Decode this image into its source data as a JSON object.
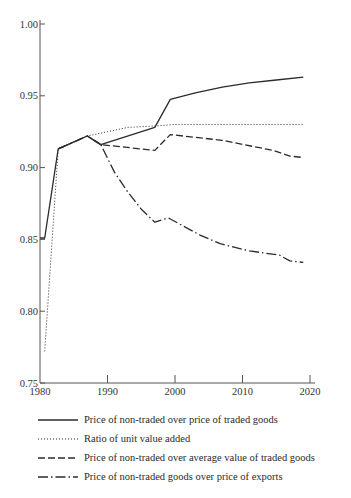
{
  "chart_data": {
    "type": "line",
    "title": "",
    "xlabel": "",
    "ylabel": "",
    "xlim": [
      1980,
      2020
    ],
    "ylim": [
      0.75,
      1.0
    ],
    "xticks": [
      1980,
      1990,
      2000,
      2010,
      2020
    ],
    "xtick_labels": [
      "1980",
      "1990",
      "2000",
      "2010",
      "2020"
    ],
    "yticks": [
      0.75,
      0.8,
      0.85,
      0.9,
      0.95,
      1.0
    ],
    "ytick_labels": [
      "0.75",
      "0.80",
      "0.85",
      "0.90",
      "0.95",
      "1.00"
    ],
    "grid": false,
    "legend_position": "below",
    "series": [
      {
        "name": "Price of non-traded over price of traded goods",
        "style": "solid",
        "x": [
          1980,
          1980.7,
          1982.7,
          1987,
          1989,
          1997,
          1999.3,
          2003,
          2007,
          2011,
          2015,
          2019
        ],
        "y": [
          0.851,
          0.851,
          0.913,
          0.922,
          0.916,
          0.928,
          0.9475,
          0.952,
          0.956,
          0.959,
          0.961,
          0.963
        ]
      },
      {
        "name": "Ratio of unit value added",
        "style": "dotted",
        "x": [
          1980.7,
          1982.7,
          1987,
          1990,
          1993,
          1997,
          2000,
          2010,
          2019
        ],
        "y": [
          0.772,
          0.913,
          0.922,
          0.925,
          0.928,
          0.929,
          0.93,
          0.93,
          0.93
        ]
      },
      {
        "name": "Price of non-traded over average value of traded goods",
        "style": "dashed",
        "x": [
          1982.7,
          1987,
          1989,
          1997,
          1999.3,
          2007,
          2014.5,
          2017,
          2019
        ],
        "y": [
          0.913,
          0.922,
          0.916,
          0.912,
          0.923,
          0.919,
          0.912,
          0.908,
          0.907
        ]
      },
      {
        "name": "Price of non-traded goods over price of exports",
        "style": "dashdot",
        "x": [
          1982.7,
          1987,
          1989,
          1991,
          1993,
          1995,
          1997,
          1999,
          2003.7,
          2006.7,
          2011,
          2015.5,
          2017,
          2019
        ],
        "y": [
          0.913,
          0.922,
          0.916,
          0.897,
          0.883,
          0.871,
          0.862,
          0.865,
          0.853,
          0.847,
          0.842,
          0.839,
          0.835,
          0.834
        ]
      }
    ]
  },
  "legend": {
    "items": [
      {
        "label": "Price of non-traded over price of traded goods",
        "style": "solid"
      },
      {
        "label": "Ratio of unit value added",
        "style": "dotted"
      },
      {
        "label": "Price of non-traded over average value of traded goods",
        "style": "dashed"
      },
      {
        "label": "Price of non-traded goods over price of exports",
        "style": "dashdot"
      }
    ]
  },
  "colors": {
    "line": "#2b2b2b",
    "axis": "#555555"
  }
}
